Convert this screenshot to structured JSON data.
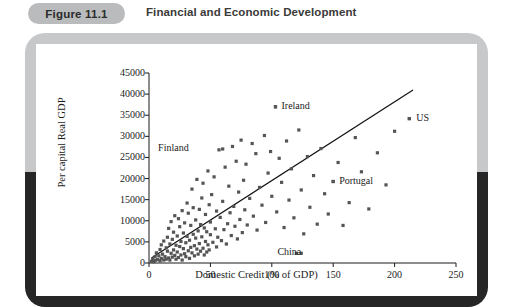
{
  "figure": {
    "badge_label": "Figure 11.1",
    "title": "Financial and Economic Development"
  },
  "chart_data": {
    "type": "scatter",
    "title": "Financial and Economic Development",
    "xlabel": "Domestic Credit (% of GDP)",
    "ylabel": "Per capital Real GDP",
    "xlim": [
      0,
      250
    ],
    "ylim": [
      0,
      45000
    ],
    "xticks": [
      0,
      50,
      100,
      150,
      200,
      250
    ],
    "yticks": [
      0,
      5000,
      10000,
      15000,
      20000,
      25000,
      30000,
      35000,
      40000,
      45000
    ],
    "grid": false,
    "legend": "none",
    "marker": "filled-square",
    "marker_color": "#555555",
    "trendline": {
      "label": "fitted line",
      "x": [
        2,
        215
      ],
      "y": [
        1200,
        41000
      ],
      "color": "#111111"
    },
    "annotations": [
      {
        "text": "Ireland",
        "x": 103,
        "y": 37000,
        "dx": 6
      },
      {
        "text": "US",
        "x": 212,
        "y": 34200,
        "dx": 7
      },
      {
        "text": "Finland",
        "x": 60,
        "y": 27000,
        "dx": -40
      },
      {
        "text": "Portugal",
        "x": 150,
        "y": 19300,
        "dx": 6
      },
      {
        "text": "China",
        "x": 124,
        "y": 2300,
        "dx": -6
      }
    ],
    "points": [
      [
        2,
        400
      ],
      [
        3,
        900
      ],
      [
        4,
        300
      ],
      [
        5,
        1500
      ],
      [
        5,
        600
      ],
      [
        6,
        2400
      ],
      [
        7,
        800
      ],
      [
        8,
        1700
      ],
      [
        9,
        3200
      ],
      [
        9,
        500
      ],
      [
        10,
        1100
      ],
      [
        10,
        4300
      ],
      [
        11,
        2100
      ],
      [
        12,
        700
      ],
      [
        12,
        5200
      ],
      [
        13,
        1500
      ],
      [
        14,
        3600
      ],
      [
        14,
        900
      ],
      [
        15,
        2800
      ],
      [
        15,
        6100
      ],
      [
        16,
        1200
      ],
      [
        16,
        8200
      ],
      [
        17,
        4500
      ],
      [
        17,
        700
      ],
      [
        18,
        2300
      ],
      [
        18,
        9800
      ],
      [
        19,
        5600
      ],
      [
        19,
        1400
      ],
      [
        20,
        3100
      ],
      [
        20,
        7300
      ],
      [
        21,
        1800
      ],
      [
        21,
        11200
      ],
      [
        22,
        4200
      ],
      [
        22,
        900
      ],
      [
        23,
        6400
      ],
      [
        23,
        2600
      ],
      [
        24,
        10500
      ],
      [
        24,
        1300
      ],
      [
        25,
        3900
      ],
      [
        25,
        8600
      ],
      [
        26,
        5100
      ],
      [
        26,
        1900
      ],
      [
        27,
        12400
      ],
      [
        27,
        700
      ],
      [
        28,
        7100
      ],
      [
        28,
        3400
      ],
      [
        29,
        2200
      ],
      [
        29,
        9500
      ],
      [
        30,
        4800
      ],
      [
        30,
        1500
      ],
      [
        31,
        14200
      ],
      [
        31,
        6300
      ],
      [
        32,
        2900
      ],
      [
        32,
        11800
      ],
      [
        33,
        5400
      ],
      [
        33,
        1100
      ],
      [
        34,
        8900
      ],
      [
        34,
        3700
      ],
      [
        35,
        17500
      ],
      [
        35,
        2400
      ],
      [
        36,
        6800
      ],
      [
        36,
        13100
      ],
      [
        37,
        4100
      ],
      [
        37,
        1700
      ],
      [
        38,
        10200
      ],
      [
        38,
        5900
      ],
      [
        39,
        3300
      ],
      [
        39,
        19800
      ],
      [
        40,
        7600
      ],
      [
        40,
        2100
      ],
      [
        41,
        12700
      ],
      [
        41,
        4600
      ],
      [
        42,
        9100
      ],
      [
        42,
        2800
      ],
      [
        43,
        15400
      ],
      [
        43,
        6200
      ],
      [
        44,
        3500
      ],
      [
        44,
        18900
      ],
      [
        45,
        8300
      ],
      [
        45,
        1900
      ],
      [
        46,
        11500
      ],
      [
        46,
        5100
      ],
      [
        47,
        7400
      ],
      [
        47,
        2600
      ],
      [
        48,
        21800
      ],
      [
        48,
        4300
      ],
      [
        49,
        13800
      ],
      [
        49,
        3100
      ],
      [
        50,
        9700
      ],
      [
        50,
        6700
      ],
      [
        51,
        16200
      ],
      [
        52,
        4900
      ],
      [
        53,
        20400
      ],
      [
        54,
        8100
      ],
      [
        55,
        12300
      ],
      [
        55,
        3800
      ],
      [
        56,
        6100
      ],
      [
        57,
        26800
      ],
      [
        58,
        10800
      ],
      [
        59,
        5300
      ],
      [
        60,
        14600
      ],
      [
        61,
        7900
      ],
      [
        62,
        22700
      ],
      [
        63,
        4500
      ],
      [
        64,
        9300
      ],
      [
        65,
        18200
      ],
      [
        66,
        11900
      ],
      [
        67,
        6500
      ],
      [
        68,
        27600
      ],
      [
        69,
        13400
      ],
      [
        70,
        8700
      ],
      [
        71,
        24100
      ],
      [
        72,
        5700
      ],
      [
        73,
        16800
      ],
      [
        74,
        10300
      ],
      [
        75,
        29100
      ],
      [
        76,
        7200
      ],
      [
        77,
        19600
      ],
      [
        78,
        12600
      ],
      [
        79,
        23400
      ],
      [
        80,
        9000
      ],
      [
        82,
        15300
      ],
      [
        84,
        28300
      ],
      [
        85,
        11100
      ],
      [
        87,
        25900
      ],
      [
        88,
        7800
      ],
      [
        90,
        17900
      ],
      [
        92,
        13700
      ],
      [
        94,
        30200
      ],
      [
        95,
        9600
      ],
      [
        97,
        21300
      ],
      [
        99,
        26400
      ],
      [
        100,
        15800
      ],
      [
        103,
        37000
      ],
      [
        104,
        12100
      ],
      [
        106,
        24800
      ],
      [
        108,
        19100
      ],
      [
        110,
        8400
      ],
      [
        112,
        28900
      ],
      [
        114,
        14900
      ],
      [
        116,
        22300
      ],
      [
        118,
        10700
      ],
      [
        120,
        2300
      ],
      [
        122,
        31500
      ],
      [
        124,
        17300
      ],
      [
        126,
        6900
      ],
      [
        129,
        25200
      ],
      [
        131,
        13200
      ],
      [
        134,
        20700
      ],
      [
        137,
        9200
      ],
      [
        140,
        27100
      ],
      [
        143,
        16400
      ],
      [
        146,
        11600
      ],
      [
        150,
        19300
      ],
      [
        154,
        23800
      ],
      [
        158,
        8900
      ],
      [
        163,
        14300
      ],
      [
        168,
        29700
      ],
      [
        173,
        21600
      ],
      [
        179,
        12800
      ],
      [
        186,
        26100
      ],
      [
        193,
        18500
      ],
      [
        200,
        31200
      ],
      [
        212,
        34200
      ]
    ]
  }
}
